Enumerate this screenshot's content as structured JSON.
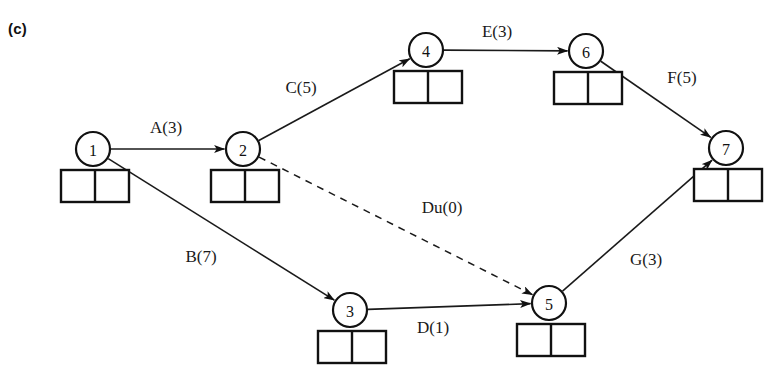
{
  "figure": {
    "panel_label": "(c)",
    "type": "activity-on-arrow-network",
    "colors": {
      "stroke": "#111111",
      "background": "#ffffff",
      "text": "#1a1a1a"
    }
  },
  "nodes": [
    {
      "id": "1",
      "label": "1",
      "cx": 93,
      "cy": 149,
      "r": 17,
      "box_x": 61,
      "box_y": 170,
      "box_w": 68,
      "box_h": 32
    },
    {
      "id": "2",
      "label": "2",
      "cx": 243,
      "cy": 149,
      "r": 17,
      "box_x": 211,
      "box_y": 170,
      "box_w": 68,
      "box_h": 32
    },
    {
      "id": "3",
      "label": "3",
      "cx": 350,
      "cy": 310,
      "r": 17,
      "box_x": 318,
      "box_y": 331,
      "box_w": 68,
      "box_h": 32
    },
    {
      "id": "4",
      "label": "4",
      "cx": 426,
      "cy": 50,
      "r": 17,
      "box_x": 394,
      "box_y": 71,
      "box_w": 68,
      "box_h": 32
    },
    {
      "id": "5",
      "label": "5",
      "cx": 549,
      "cy": 303,
      "r": 17,
      "box_x": 517,
      "box_y": 324,
      "box_w": 68,
      "box_h": 32
    },
    {
      "id": "6",
      "label": "6",
      "cx": 586,
      "cy": 51,
      "r": 17,
      "box_x": 554,
      "box_y": 72,
      "box_w": 68,
      "box_h": 32
    },
    {
      "id": "7",
      "label": "7",
      "cx": 726,
      "cy": 148,
      "r": 17,
      "box_x": 694,
      "box_y": 169,
      "box_w": 68,
      "box_h": 32
    }
  ],
  "edges": [
    {
      "id": "A",
      "label": "A(3)",
      "from": "1",
      "to": "2",
      "duration": 3,
      "style": "solid",
      "label_x": 166,
      "label_y": 127
    },
    {
      "id": "B",
      "label": "B(7)",
      "from": "1",
      "to": "3",
      "duration": 7,
      "style": "solid",
      "label_x": 201,
      "label_y": 256
    },
    {
      "id": "C",
      "label": "C(5)",
      "from": "2",
      "to": "4",
      "duration": 5,
      "style": "solid",
      "label_x": 301,
      "label_y": 87
    },
    {
      "id": "D",
      "label": "D(1)",
      "from": "3",
      "to": "5",
      "duration": 1,
      "style": "solid",
      "label_x": 433,
      "label_y": 327
    },
    {
      "id": "E",
      "label": "E(3)",
      "from": "4",
      "to": "6",
      "duration": 3,
      "style": "solid",
      "label_x": 497,
      "label_y": 31
    },
    {
      "id": "F",
      "label": "F(5)",
      "from": "6",
      "to": "7",
      "duration": 5,
      "style": "solid",
      "label_x": 682,
      "label_y": 77
    },
    {
      "id": "G",
      "label": "G(3)",
      "from": "5",
      "to": "7",
      "duration": 3,
      "style": "solid",
      "label_x": 646,
      "label_y": 259
    },
    {
      "id": "Du",
      "label": "Du(0)",
      "from": "2",
      "to": "5",
      "duration": 0,
      "style": "dashed",
      "label_x": 442,
      "label_y": 207
    }
  ]
}
